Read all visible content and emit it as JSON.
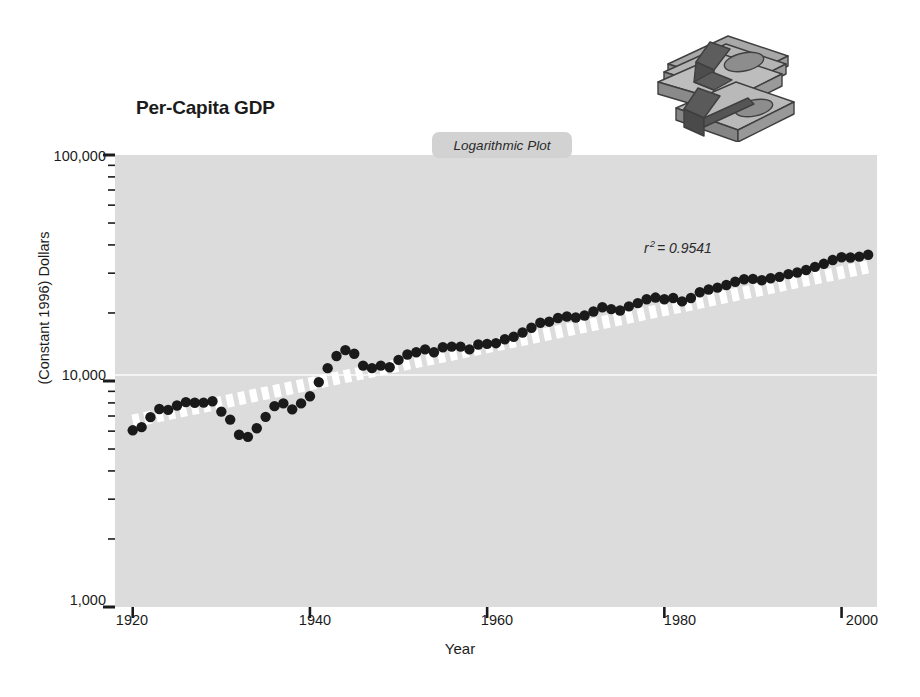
{
  "figure": {
    "title": "Per-Capita GDP",
    "plot_type_badge": "Logarithmic Plot",
    "annotation_r": "r",
    "annotation_exp": "2",
    "annotation_value": "= 0.9541",
    "clipart_name": "stack-of-cash-clipart",
    "background_color": "#ffffff",
    "plot_background_color": "#dcdcdc",
    "marker_color": "#1a1a1a",
    "trendline_color": "#ffffff",
    "gridline_color": "#ffffff"
  },
  "chart_data": {
    "type": "scatter",
    "title": "Per-Capita GDP",
    "subtitle": "Logarithmic Plot",
    "xlabel": "Year",
    "ylabel": "(Constant 1996) Dollars",
    "xlim": [
      1918,
      2004
    ],
    "ylim": [
      1000,
      100000
    ],
    "yscale": "log",
    "xtick_labels": [
      "1920",
      "1940",
      "1960",
      "1980",
      "2000"
    ],
    "xticks": [
      1920,
      1940,
      1960,
      1980,
      2000
    ],
    "ytick_labels": [
      "100,000",
      "10,000",
      "1,000"
    ],
    "yticks": [
      100000,
      10000,
      1000
    ],
    "y_minor_ticks": [
      90000,
      80000,
      70000,
      60000,
      50000,
      40000,
      30000,
      20000,
      9000,
      8000,
      7000,
      6000,
      5000,
      4000,
      3000,
      2000
    ],
    "grid": "single horizontal white gridline at 10,000",
    "legend": "none",
    "annotations": [
      {
        "text": "r 2 = 0.9541",
        "x": 1978,
        "y": 30000
      }
    ],
    "trendline": {
      "type": "exponential-fit",
      "style": "thick white dashed band",
      "r_squared": 0.9541,
      "start": {
        "x": 1920,
        "y": 6650
      },
      "end": {
        "x": 2003,
        "y": 32000
      }
    },
    "series": [
      {
        "name": "Per-Capita GDP",
        "marker": "filled circle",
        "x": [
          1920,
          1921,
          1922,
          1923,
          1924,
          1925,
          1926,
          1927,
          1928,
          1929,
          1930,
          1931,
          1932,
          1933,
          1934,
          1935,
          1936,
          1937,
          1938,
          1939,
          1940,
          1941,
          1942,
          1943,
          1944,
          1945,
          1946,
          1947,
          1948,
          1949,
          1950,
          1951,
          1952,
          1953,
          1954,
          1955,
          1956,
          1957,
          1958,
          1959,
          1960,
          1961,
          1962,
          1963,
          1964,
          1965,
          1966,
          1967,
          1968,
          1969,
          1970,
          1971,
          1972,
          1973,
          1974,
          1975,
          1976,
          1977,
          1978,
          1979,
          1980,
          1981,
          1982,
          1983,
          1984,
          1985,
          1986,
          1987,
          1988,
          1989,
          1990,
          1991,
          1992,
          1993,
          1994,
          1995,
          1996,
          1997,
          1998,
          1999,
          2000,
          2001,
          2002,
          2003
        ],
        "y": [
          6050,
          6250,
          6920,
          7520,
          7450,
          7790,
          8060,
          8010,
          8020,
          8140,
          7320,
          6750,
          5780,
          5660,
          6180,
          6940,
          7740,
          7960,
          7490,
          7960,
          8560,
          9890,
          11400,
          12900,
          13700,
          13200,
          11700,
          11400,
          11700,
          11500,
          12400,
          13100,
          13400,
          13800,
          13400,
          14100,
          14200,
          14200,
          13800,
          14500,
          14600,
          14700,
          15300,
          15700,
          16400,
          17200,
          18100,
          18300,
          19000,
          19300,
          19100,
          19500,
          20300,
          21200,
          20800,
          20500,
          21400,
          22100,
          23000,
          23400,
          23000,
          23300,
          22500,
          23300,
          24700,
          25400,
          25900,
          26600,
          27500,
          28200,
          28300,
          27900,
          28500,
          28900,
          29700,
          30200,
          31000,
          32000,
          33000,
          34300,
          35300,
          35200,
          35500,
          36200
        ]
      }
    ]
  },
  "y_axis": {
    "labels": [
      {
        "text": "100,000",
        "top": 148
      },
      {
        "text": "10,000",
        "top": 367
      },
      {
        "text": "1,000",
        "top": 592
      }
    ],
    "title": "(Constant 1996) Dollars"
  },
  "x_axis": {
    "labels": [
      {
        "text": "1920",
        "left": 132
      },
      {
        "text": "1940",
        "left": 315
      },
      {
        "text": "1960",
        "left": 497
      },
      {
        "text": "1980",
        "left": 680
      },
      {
        "text": "2000",
        "left": 862
      }
    ],
    "title": "Year"
  }
}
